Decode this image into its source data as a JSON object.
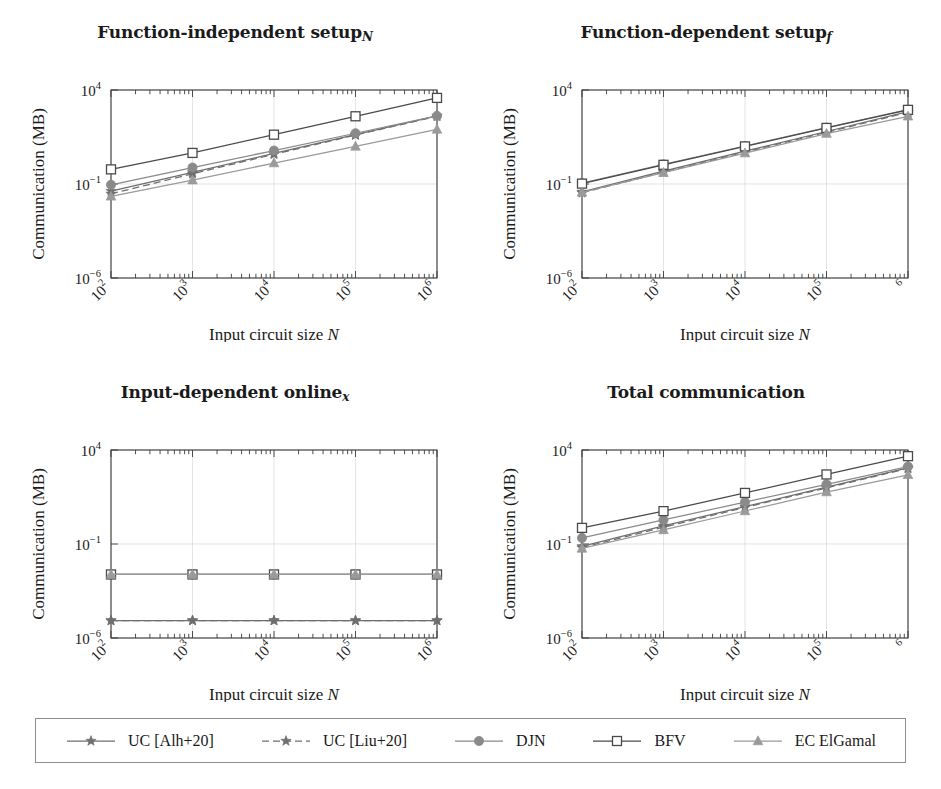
{
  "figure": {
    "width": 941,
    "height": 789,
    "axis_label_y": "Communication (MB)",
    "axis_label_x_prefix": "Input circuit size ",
    "axis_label_x_italic": "N"
  },
  "legend": {
    "name": "series-legend",
    "items": [
      {
        "label": "UC [Alh+20]",
        "marker": "star-marker",
        "line": "solid",
        "color": "#6e6e6e",
        "key": "uc_alh20"
      },
      {
        "label": "UC [Liu+20]",
        "marker": "star-marker",
        "line": "dashed",
        "color": "#6e6e6e",
        "key": "uc_liu20"
      },
      {
        "label": "DJN",
        "marker": "circle-marker",
        "line": "solid",
        "color": "#8a8a8a",
        "key": "djn"
      },
      {
        "label": "BFV",
        "marker": "square-marker",
        "line": "solid",
        "color": "#4a4a4a",
        "key": "bfv"
      },
      {
        "label": "EC ElGamal",
        "marker": "triangle-marker",
        "line": "solid",
        "color": "#9a9a9a",
        "key": "ec_elgamal"
      }
    ]
  },
  "chart_data": [
    {
      "id": "function-independent-setup",
      "type": "line",
      "title": "Function-independent setup",
      "title_sub": "N",
      "xlabel": "Input circuit size N",
      "ylabel": "Communication (MB)",
      "xscale": "log",
      "yscale": "log",
      "x": [
        100,
        1000,
        10000,
        100000,
        1000000
      ],
      "xtick_labels": [
        "10^2",
        "10^3",
        "10^4",
        "10^5",
        "10^6"
      ],
      "xtick_bases": [
        "10",
        "10",
        "10",
        "10",
        "10"
      ],
      "xtick_exps": [
        "2",
        "3",
        "4",
        "5",
        "6"
      ],
      "ytick_labels": [
        "10^4",
        "10^-1",
        "10^-6"
      ],
      "ytick_values": [
        10000,
        0.1,
        1e-06
      ],
      "ylim": [
        1e-06,
        10000
      ],
      "xlim": [
        100,
        1000000
      ],
      "grid": true,
      "legend_position": "below-figure",
      "series": [
        {
          "name": "UC [Alh+20]",
          "values": [
            0.042,
            0.42,
            4.2,
            42,
            420
          ]
        },
        {
          "name": "UC [Liu+20]",
          "values": [
            0.03,
            0.35,
            3.8,
            40,
            400
          ]
        },
        {
          "name": "DJN",
          "values": [
            0.09,
            0.75,
            6.0,
            50,
            420
          ]
        },
        {
          "name": "BFV",
          "values": [
            0.6,
            4.5,
            42,
            400,
            3800
          ]
        },
        {
          "name": "EC ElGamal",
          "values": [
            0.022,
            0.16,
            1.3,
            10.0,
            80
          ]
        }
      ]
    },
    {
      "id": "function-dependent-setup",
      "type": "line",
      "title": "Function-dependent setup",
      "title_sub": "f",
      "xlabel": "Input circuit size N",
      "ylabel": "Communication (MB)",
      "xscale": "log",
      "yscale": "log",
      "x": [
        100,
        1000,
        10000,
        100000,
        1000000
      ],
      "xtick_labels": [
        "10^2",
        "10^3",
        "10^4",
        "10^5",
        "6"
      ],
      "xtick_bases": [
        "10",
        "10",
        "10",
        "10",
        ""
      ],
      "xtick_exps": [
        "2",
        "3",
        "4",
        "5",
        "6"
      ],
      "ytick_labels": [
        "10^4",
        "10^-1",
        "10^-6"
      ],
      "ytick_values": [
        10000,
        0.1,
        1e-06
      ],
      "ylim": [
        1e-06,
        10000
      ],
      "xlim": [
        100,
        1000000
      ],
      "grid": true,
      "legend_position": "below-figure",
      "series": [
        {
          "name": "UC [Alh+20]",
          "values": [
            0.038,
            0.48,
            5.6,
            62,
            700
          ]
        },
        {
          "name": "UC [Liu+20]",
          "values": [
            0.034,
            0.42,
            5.0,
            56,
            640
          ]
        },
        {
          "name": "DJN",
          "values": [
            0.11,
            1.1,
            10.5,
            100,
            900
          ]
        },
        {
          "name": "BFV",
          "values": [
            0.105,
            1.05,
            10.0,
            96,
            880
          ]
        },
        {
          "name": "EC ElGamal",
          "values": [
            0.036,
            0.4,
            4.4,
            48,
            400
          ]
        }
      ]
    },
    {
      "id": "input-dependent-online",
      "type": "line",
      "title": "Input-dependent online",
      "title_sub": "x",
      "xlabel": "Input circuit size N",
      "ylabel": "Communication (MB)",
      "xscale": "log",
      "yscale": "log",
      "x": [
        100,
        1000,
        10000,
        100000,
        1000000
      ],
      "xtick_labels": [
        "10^2",
        "10^3",
        "10^4",
        "10^5",
        "10^6"
      ],
      "xtick_bases": [
        "10",
        "10",
        "10",
        "10",
        "10"
      ],
      "xtick_exps": [
        "2",
        "3",
        "4",
        "5",
        "6"
      ],
      "ytick_labels": [
        "10^4",
        "10^-1",
        "10^-6"
      ],
      "ytick_values": [
        10000,
        0.1,
        1e-06
      ],
      "ylim": [
        1e-06,
        10000
      ],
      "xlim": [
        100,
        1000000
      ],
      "grid": true,
      "legend_position": "below-figure",
      "series": [
        {
          "name": "UC [Alh+20]",
          "values": [
            8.5e-06,
            8.5e-06,
            8.5e-06,
            8.5e-06,
            8.5e-06
          ]
        },
        {
          "name": "UC [Liu+20]",
          "values": [
            8.5e-06,
            8.5e-06,
            8.5e-06,
            8.5e-06,
            8.5e-06
          ]
        },
        {
          "name": "DJN",
          "values": [
            0.0024,
            0.0024,
            0.0024,
            0.0024,
            0.0024
          ]
        },
        {
          "name": "BFV",
          "values": [
            0.0024,
            0.0024,
            0.0024,
            0.0024,
            0.0024
          ]
        },
        {
          "name": "EC ElGamal",
          "values": [
            0.0024,
            0.0024,
            0.0024,
            0.0024,
            0.0024
          ]
        }
      ]
    },
    {
      "id": "total-communication",
      "type": "line",
      "title": "Total communication",
      "title_sub": "",
      "xlabel": "Input circuit size N",
      "ylabel": "Communication (MB)",
      "xscale": "log",
      "yscale": "log",
      "x": [
        100,
        1000,
        10000,
        100000,
        1000000
      ],
      "xtick_labels": [
        "10^2",
        "10^3",
        "10^4",
        "10^5",
        "6"
      ],
      "xtick_bases": [
        "10",
        "10",
        "10",
        "10",
        ""
      ],
      "xtick_exps": [
        "2",
        "3",
        "4",
        "5",
        "6"
      ],
      "ytick_labels": [
        "10^4",
        "10^-1",
        "10^-6"
      ],
      "ytick_values": [
        10000,
        0.1,
        1e-06
      ],
      "ylim": [
        1e-06,
        10000
      ],
      "xlim": [
        100,
        1000000
      ],
      "grid": true,
      "legend_position": "below-figure",
      "series": [
        {
          "name": "UC [Alh+20]",
          "values": [
            0.075,
            0.92,
            9.8,
            105,
            1120
          ]
        },
        {
          "name": "UC [Liu+20]",
          "values": [
            0.064,
            0.78,
            8.8,
            96,
            1040
          ]
        },
        {
          "name": "DJN",
          "values": [
            0.21,
            1.9,
            17,
            150,
            1320
          ]
        },
        {
          "name": "BFV",
          "values": [
            0.72,
            5.6,
            52,
            500,
            4700
          ]
        },
        {
          "name": "EC ElGamal",
          "values": [
            0.058,
            0.56,
            5.7,
            58,
            480
          ]
        }
      ]
    }
  ]
}
